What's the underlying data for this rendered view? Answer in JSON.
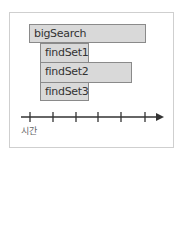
{
  "diagram": {
    "type": "timeline-call-stack",
    "bars": [
      {
        "label": "bigSearch",
        "x": 29,
        "y": 24,
        "w": 117,
        "h": 19
      },
      {
        "label": "findSet1",
        "x": 40,
        "y": 43,
        "w": 49,
        "h": 19
      },
      {
        "label": "findSet2",
        "x": 40,
        "y": 62,
        "w": 92,
        "h": 20
      },
      {
        "label": "findSet3",
        "x": 40,
        "y": 82,
        "w": 49,
        "h": 19
      }
    ],
    "axis": {
      "label": "시간",
      "y": 117,
      "x_start": 21,
      "x_end": 163,
      "ticks": [
        30,
        53,
        76,
        98,
        121,
        145
      ]
    },
    "colors": {
      "bar_fill": "#d9d9d9",
      "bar_border": "#8a8a8a",
      "axis": "#333333",
      "frame": "#cfcfcf"
    }
  }
}
